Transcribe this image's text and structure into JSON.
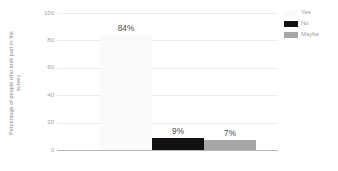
{
  "chart_data": {
    "type": "bar",
    "title": "",
    "subtitle": "",
    "xlabel": "",
    "ylabel": "Percentage of people who took part in the survey",
    "ylabel_lines": [
      "Percentage of people who took part in the",
      "survey"
    ],
    "categories": [
      "Yes",
      "No",
      "Maybe"
    ],
    "values": [
      84,
      9,
      7
    ],
    "value_labels": [
      "84%",
      "9%",
      "7%"
    ],
    "series": [
      {
        "name": "Survey response",
        "values": [
          84,
          9,
          7
        ]
      }
    ],
    "ylim": [
      0,
      100
    ],
    "yticks": [
      100,
      80,
      60,
      40,
      20,
      0
    ],
    "ytick_labels": [
      "100",
      "80",
      "60",
      "40",
      "20",
      "0"
    ],
    "xtick_labels": [],
    "grid": true,
    "grid_axis": "y",
    "legend_position": "top-right",
    "colors": {
      "bar_yes": "#fafafa",
      "bar_no": "#111111",
      "bar_maybe": "#a6a6a6",
      "gridline": "#ececec",
      "axis_line": "#b6b6b6",
      "tick_text": "#a2a2a2",
      "label_text": "#4a4a4a",
      "axis_title": "#8d8d8d",
      "background": "#ffffff"
    }
  },
  "legend": {
    "items": [
      {
        "label": "Yes",
        "color": "#fafafa"
      },
      {
        "label": "No",
        "color": "#111111"
      },
      {
        "label": "Maybe",
        "color": "#a6a6a6"
      }
    ]
  }
}
